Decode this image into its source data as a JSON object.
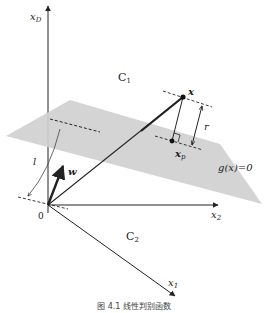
{
  "figure": {
    "caption": "图 4.1 线性判别函数",
    "plane_label": "g(x)=0",
    "colors": {
      "plane": "#d0d0d0",
      "axis": "#222222",
      "background": "#ffffff"
    },
    "axes": {
      "xD": "x",
      "xD_sub": "D",
      "x1": "x",
      "x1_sub": "1",
      "x2": "x",
      "x2_sub": "2",
      "origin": "0"
    },
    "regions": {
      "c1": "C",
      "c1_sub": "1",
      "c2": "C",
      "c2_sub": "2"
    },
    "points": {
      "x": "x",
      "xp": "x",
      "xp_sub": "p"
    },
    "vectors": {
      "w": "w"
    },
    "distances": {
      "r": "r",
      "l": "l"
    }
  }
}
